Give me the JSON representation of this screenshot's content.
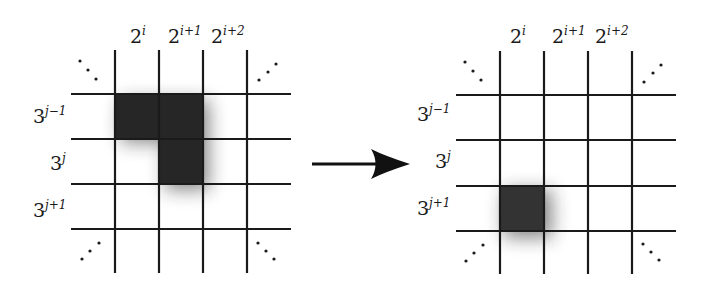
{
  "figure": {
    "colors": {
      "background": "#ffffff",
      "line": "#1a1a1a",
      "shade": "#262626"
    },
    "left_grid": {
      "column_labels": [
        {
          "base": "2",
          "exp": "i"
        },
        {
          "base": "2",
          "exp": "i+1"
        },
        {
          "base": "2",
          "exp": "i+2"
        }
      ],
      "row_labels": [
        {
          "base": "3",
          "exp": "j−1"
        },
        {
          "base": "3",
          "exp": "j"
        },
        {
          "base": "3",
          "exp": "j+1"
        }
      ],
      "shaded_cells": [
        {
          "col": "2^i",
          "row": "3^{j-1}"
        },
        {
          "col": "2^{i+1}",
          "row": "3^{j-1}"
        },
        {
          "col": "2^{i+1}",
          "row": "3^j"
        }
      ],
      "corner_ellipses": [
        "⋱",
        "⋰",
        "⋰",
        "⋱"
      ]
    },
    "arrow": {
      "direction": "right",
      "icon": "arrow-right-icon"
    },
    "right_grid": {
      "column_labels": [
        {
          "base": "2",
          "exp": "i"
        },
        {
          "base": "2",
          "exp": "i+1"
        },
        {
          "base": "2",
          "exp": "i+2"
        }
      ],
      "row_labels": [
        {
          "base": "3",
          "exp": "j−1"
        },
        {
          "base": "3",
          "exp": "j"
        },
        {
          "base": "3",
          "exp": "j+1"
        }
      ],
      "shaded_cells": [
        {
          "col": "2^i",
          "row": "3^{j+1}"
        }
      ],
      "corner_ellipses": [
        "⋱",
        "⋰",
        "⋰",
        "⋱"
      ]
    }
  }
}
